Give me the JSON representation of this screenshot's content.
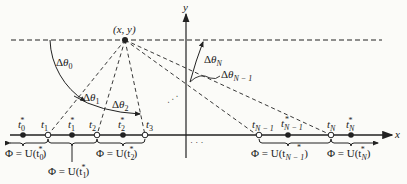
{
  "diagram": {
    "point_label": "(x, y)",
    "axes": {
      "x_label": "x",
      "y_label": "y"
    },
    "angles": [
      {
        "id": "dtheta0",
        "label": "Δθ",
        "sub": "0"
      },
      {
        "id": "dtheta1",
        "label": "Δθ",
        "sub": "1"
      },
      {
        "id": "dtheta2",
        "label": "Δθ",
        "sub": "2"
      },
      {
        "id": "dthetaN",
        "label": "Δθ",
        "sub": "N"
      },
      {
        "id": "dthetaNm1",
        "label": "Δθ",
        "sub": "N − 1"
      }
    ],
    "nodes": [
      {
        "label": "t",
        "sub": "0",
        "star": true,
        "kind": "filled"
      },
      {
        "label": "t",
        "sub": "1",
        "star": false,
        "kind": "hollow"
      },
      {
        "label": "t",
        "sub": "1",
        "star": true,
        "kind": "filled"
      },
      {
        "label": "t",
        "sub": "2",
        "star": false,
        "kind": "hollow"
      },
      {
        "label": "t",
        "sub": "2",
        "star": true,
        "kind": "filled"
      },
      {
        "label": "t",
        "sub": "3",
        "star": false,
        "kind": "hollow"
      },
      {
        "label": "t",
        "sub": "N − 1",
        "star": false,
        "kind": "hollow"
      },
      {
        "label": "t",
        "sub": "N − 1",
        "star": true,
        "kind": "filled"
      },
      {
        "label": "t",
        "sub": "N",
        "star": false,
        "kind": "hollow"
      },
      {
        "label": "t",
        "sub": "N",
        "star": true,
        "kind": "filled"
      }
    ],
    "intervals": [
      {
        "prefix": "Φ = U(t",
        "sub": "0",
        "suffix": ")"
      },
      {
        "prefix": "Φ = U(t",
        "sub": "1",
        "suffix": ")"
      },
      {
        "prefix": "Φ = U(t",
        "sub": "2",
        "suffix": ")"
      },
      {
        "prefix": "Φ = U(t",
        "sub": "N − 1",
        "suffix": ")"
      },
      {
        "prefix": "Φ = U(t",
        "sub": "N",
        "suffix": ")"
      }
    ],
    "ellipsis": "· · ·",
    "colors": {
      "ink": "#222222",
      "background": "#fbfbf8"
    }
  }
}
